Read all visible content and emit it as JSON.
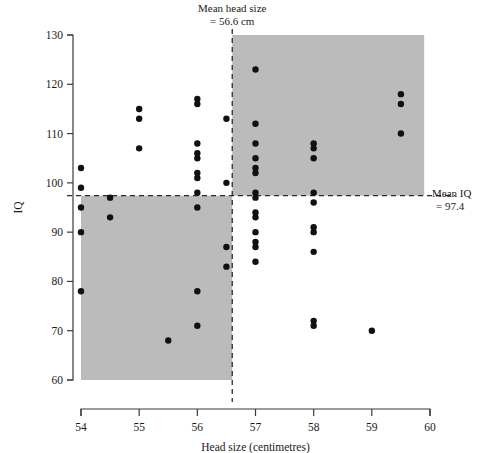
{
  "chart_data": {
    "type": "scatter",
    "title": "",
    "xlabel": "Head size (centimetres)",
    "ylabel": "IQ",
    "xlim": [
      54,
      60
    ],
    "ylim": [
      60,
      130
    ],
    "xticks": [
      54,
      55,
      56,
      57,
      58,
      59,
      60
    ],
    "xtick_labels": [
      "54",
      "55",
      "56",
      "57",
      "58",
      "59",
      "60"
    ],
    "yticks": [
      60,
      70,
      80,
      90,
      100,
      110,
      120,
      130
    ],
    "ytick_labels": [
      "60",
      "70",
      "80",
      "90",
      "100",
      "110",
      "120",
      "130"
    ],
    "grid": false,
    "legend": null,
    "mean_x": 56.6,
    "mean_y": 97.4,
    "annotations": [
      {
        "name": "mean-head-size-label",
        "line1": "Mean head size",
        "line2": "= 56.6 cm",
        "x": 56.6,
        "position": "top"
      },
      {
        "name": "mean-iq-label",
        "line1": "Mean IQ",
        "line2": "= 97.4",
        "y": 97.4,
        "position": "right"
      }
    ],
    "shaded_quadrants": [
      {
        "name": "lower-left-quadrant",
        "x_range": [
          54,
          56.6
        ],
        "y_range": [
          60,
          97.4
        ],
        "color": "#bbbbbb"
      },
      {
        "name": "upper-right-quadrant",
        "x_range": [
          56.6,
          59.9
        ],
        "y_range": [
          97.4,
          130
        ],
        "color": "#bbbbbb"
      }
    ],
    "points": [
      [
        54,
        103
      ],
      [
        54,
        99
      ],
      [
        54,
        95
      ],
      [
        54,
        90
      ],
      [
        54,
        78
      ],
      [
        54.5,
        97
      ],
      [
        54.5,
        93
      ],
      [
        55,
        115
      ],
      [
        55,
        113
      ],
      [
        55,
        107
      ],
      [
        55.5,
        68
      ],
      [
        56,
        117
      ],
      [
        56,
        116
      ],
      [
        56,
        108
      ],
      [
        56,
        106
      ],
      [
        56,
        105
      ],
      [
        56,
        102
      ],
      [
        56,
        101
      ],
      [
        56,
        98
      ],
      [
        56,
        95
      ],
      [
        56,
        78
      ],
      [
        56,
        71
      ],
      [
        56.5,
        113
      ],
      [
        56.5,
        100
      ],
      [
        56.5,
        87
      ],
      [
        56.5,
        83
      ],
      [
        57,
        123
      ],
      [
        57,
        112
      ],
      [
        57,
        108
      ],
      [
        57,
        105
      ],
      [
        57,
        103
      ],
      [
        57,
        102
      ],
      [
        57,
        98
      ],
      [
        57,
        97
      ],
      [
        57,
        94
      ],
      [
        57,
        93
      ],
      [
        57,
        90
      ],
      [
        57,
        88
      ],
      [
        57,
        87
      ],
      [
        57,
        84
      ],
      [
        58,
        108
      ],
      [
        58,
        107
      ],
      [
        58,
        105
      ],
      [
        58,
        98
      ],
      [
        58,
        96
      ],
      [
        58,
        91
      ],
      [
        58,
        90
      ],
      [
        58,
        86
      ],
      [
        58,
        72
      ],
      [
        58,
        71
      ],
      [
        59,
        70
      ],
      [
        59.5,
        118
      ],
      [
        59.5,
        116
      ],
      [
        59.5,
        110
      ]
    ]
  }
}
